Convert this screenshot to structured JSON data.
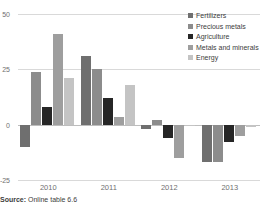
{
  "chart_data": {
    "type": "bar",
    "title": "",
    "subtitle": "",
    "xlabel": "",
    "ylabel": "",
    "categories": [
      "2010",
      "2011",
      "2012",
      "2013"
    ],
    "ylim": [
      -25,
      50
    ],
    "yticks": [
      50,
      25,
      0,
      -25
    ],
    "ytick_labels": [
      "50",
      "25",
      "0",
      "-25"
    ],
    "grid": true,
    "legend_position": "top-right",
    "zero_line": 0,
    "series": [
      {
        "name": "Fertilizers",
        "color": "#6f6f6f",
        "values": [
          -10,
          31,
          -2,
          -17
        ]
      },
      {
        "name": "Precious metals",
        "color": "#8c8c8c",
        "values": [
          24,
          25,
          2,
          -17
        ]
      },
      {
        "name": "Agriculture",
        "color": "#262626",
        "values": [
          8,
          12,
          -6,
          -8
        ]
      },
      {
        "name": "Metals and minerals",
        "color": "#9e9e9e",
        "values": [
          41,
          3.5,
          -15,
          -5
        ]
      },
      {
        "name": "Energy",
        "color": "#c4c4c4",
        "values": [
          21,
          18,
          -0.5,
          -1
        ]
      }
    ]
  },
  "legend": {
    "items": [
      {
        "label": "Fertilizers"
      },
      {
        "label": "Precious metals"
      },
      {
        "label": "Agriculture"
      },
      {
        "label": "Metals and minerals"
      },
      {
        "label": "Energy"
      }
    ]
  },
  "footer": {
    "source_label": "Source:",
    "source_text": "Online table 6.6"
  }
}
